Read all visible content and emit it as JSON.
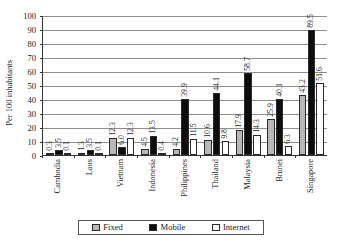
{
  "chart_data": {
    "type": "bar",
    "title": "",
    "subtitle": "",
    "xlabel": "",
    "ylabel": "Per 100 inhabitants",
    "ylim": [
      0,
      100
    ],
    "yticks": [
      0,
      10,
      20,
      30,
      40,
      50,
      60,
      70,
      80,
      90,
      100
    ],
    "ytick_labels": [
      "0",
      "10",
      "20",
      "30",
      "40",
      "50",
      "60",
      "70",
      "80",
      "90",
      "100"
    ],
    "grid": true,
    "legend_position": "bottom",
    "categories": [
      "Cambodia",
      "Laos",
      "Vietnam",
      "Indonesia",
      "Philippines",
      "Thailand",
      "Malaysia",
      "Brunei",
      "Singapore"
    ],
    "series": [
      {
        "name": "Fixed",
        "color": "#b8b8b8",
        "values": [
          0.3,
          1.3,
          12.3,
          4.5,
          4.2,
          10.6,
          17.9,
          25.9,
          43.2
        ],
        "labels": [
          "0.3",
          "1.3",
          "12.3",
          "4.5",
          "4.2",
          "10.6",
          "17.9",
          "25.9",
          "43.2"
        ]
      },
      {
        "name": "Mobile",
        "color": "#0d0d0d",
        "values": [
          3.5,
          3.5,
          6.0,
          13.5,
          39.9,
          44.1,
          58.7,
          40.1,
          89.5
        ],
        "labels": [
          "3.5",
          "3.5",
          "6.0",
          "13.5",
          "39.9",
          "44.1",
          "58.7",
          "40.1",
          "89.5"
        ]
      },
      {
        "name": "Internet",
        "color": "#ffffff",
        "values": [
          0.1,
          0.1,
          12.3,
          0.4,
          11.5,
          9.8,
          14.3,
          6.3,
          51.6
        ],
        "labels": [
          "0.1",
          "0.1",
          "12.3",
          "0.4",
          "11.5",
          "9.8",
          "14.3",
          "6.3",
          "51.6"
        ]
      }
    ]
  },
  "legend": {
    "items": [
      {
        "label": "Fixed",
        "swatch": "fixed-swatch-icon"
      },
      {
        "label": "Mobile",
        "swatch": "mobile-swatch-icon"
      },
      {
        "label": "Internet",
        "swatch": "internet-swatch-icon"
      }
    ]
  }
}
